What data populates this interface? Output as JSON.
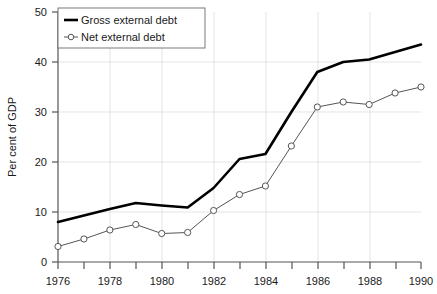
{
  "chart_data": {
    "type": "line",
    "title": "",
    "xlabel": "",
    "ylabel": "Per cent of GDP",
    "x": [
      1976,
      1977,
      1978,
      1979,
      1980,
      1981,
      1982,
      1983,
      1984,
      1985,
      1986,
      1987,
      1988,
      1989,
      1990
    ],
    "xlim": [
      1976,
      1990
    ],
    "ylim": [
      0,
      50
    ],
    "yticks": [
      0,
      10,
      20,
      30,
      40,
      50
    ],
    "xticks_labeled": [
      1976,
      1978,
      1980,
      1982,
      1984,
      1986,
      1988,
      1990
    ],
    "xticks_minor": [
      1977,
      1979,
      1981,
      1983,
      1985,
      1987,
      1989
    ],
    "grid": true,
    "legend_position": "top-left",
    "series": [
      {
        "name": "Gross external debt",
        "marker": "none",
        "color": "#000000",
        "linewidth": 2.6,
        "values": [
          8.0,
          9.3,
          10.6,
          11.8,
          11.3,
          10.9,
          14.8,
          20.6,
          21.6,
          30.0,
          38.0,
          40.0,
          40.5,
          42.0,
          43.5
        ]
      },
      {
        "name": "Net external debt",
        "marker": "circle-open",
        "color": "#555555",
        "linewidth": 1.0,
        "values": [
          3.1,
          4.6,
          6.4,
          7.5,
          5.7,
          5.9,
          10.3,
          13.5,
          15.2,
          23.2,
          31.0,
          32.0,
          31.5,
          33.8,
          35.0
        ]
      }
    ]
  },
  "yaxis": {
    "label": "Per cent of GDP",
    "tick_labels": [
      "0",
      "10",
      "20",
      "30",
      "40",
      "50"
    ]
  },
  "xaxis": {
    "tick_labels": [
      "1976",
      "1978",
      "1980",
      "1982",
      "1984",
      "1986",
      "1988",
      "1990"
    ]
  },
  "legend": {
    "entries": [
      {
        "label": "Gross external debt",
        "marker": "line"
      },
      {
        "label": "Net external debt",
        "marker": "circle-open-line"
      }
    ]
  }
}
